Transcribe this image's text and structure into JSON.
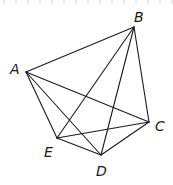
{
  "diagram": {
    "type": "geometry-figure",
    "points": [
      {
        "name": "A",
        "x": 26,
        "y": 72,
        "label_x": 10,
        "label_y": 74
      },
      {
        "name": "B",
        "x": 134,
        "y": 27,
        "label_x": 134,
        "label_y": 22
      },
      {
        "name": "C",
        "x": 149,
        "y": 122,
        "label_x": 155,
        "label_y": 131
      },
      {
        "name": "D",
        "x": 101,
        "y": 155,
        "label_x": 96,
        "label_y": 176
      },
      {
        "name": "E",
        "x": 57,
        "y": 138,
        "label_x": 44,
        "label_y": 157
      }
    ],
    "segments": [
      [
        "A",
        "B"
      ],
      [
        "A",
        "C"
      ],
      [
        "A",
        "E"
      ],
      [
        "A",
        "D"
      ],
      [
        "B",
        "C"
      ],
      [
        "B",
        "E"
      ],
      [
        "B",
        "D"
      ],
      [
        "C",
        "E"
      ],
      [
        "C",
        "D"
      ],
      [
        "E",
        "D"
      ]
    ],
    "colors": {
      "stroke": "#1a1a1a",
      "background": "#ffffff",
      "ticks": "#d6d6d6"
    }
  }
}
